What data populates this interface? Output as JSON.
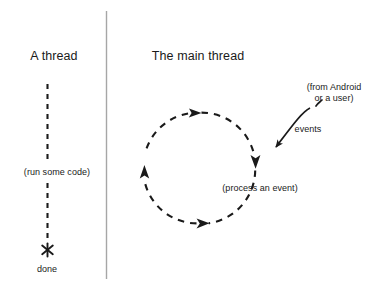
{
  "diagram": {
    "title_left": "A thread",
    "title_right": "The main thread",
    "left_thread": {
      "run_label": "(run some code)",
      "end_label": "done",
      "end_marker": "asterisk-marker"
    },
    "main_thread": {
      "loop_label": "(process an event)",
      "events_label": "events",
      "source_line_1": "(from Android",
      "source_line_2": "or a user)"
    },
    "colors": {
      "ink": "#1a1a1a",
      "divider": "#9a9a9a",
      "background": "#ffffff"
    }
  }
}
